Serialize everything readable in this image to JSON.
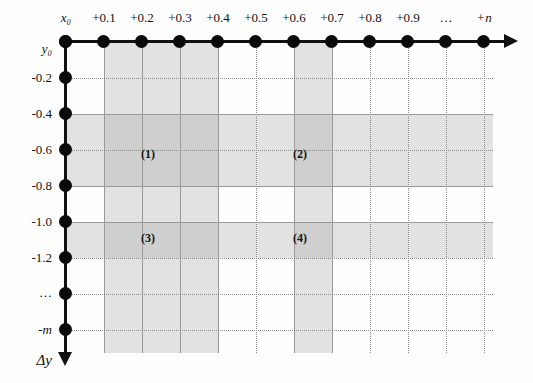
{
  "figure": {
    "background_color": "#ffffff",
    "axis_color": "#111111",
    "band_color": "#aaaaaa",
    "grid_color": "#8d8d8d"
  },
  "x_axis": {
    "name": "x-axis",
    "origin_label": "x₀",
    "labels": [
      "x₀",
      "+0.1",
      "+0.2",
      "+0.3",
      "+0.4",
      "+0.5",
      "+0.6",
      "+0.7",
      "+0.8",
      "+0.9",
      "…",
      "+n"
    ],
    "tick_count": 12,
    "arrow": "right"
  },
  "y_axis": {
    "name": "y-axis",
    "origin_label": "y₀",
    "labels": [
      "y₀",
      "-0.2",
      "-0.4",
      "-0.6",
      "-0.8",
      "-1.0",
      "-1.2",
      "…",
      "-m"
    ],
    "increment_label": "Δy",
    "tick_count": 9,
    "arrow": "down"
  },
  "regions": [
    {
      "label": "(1)",
      "name": "region-1"
    },
    {
      "label": "(2)",
      "name": "region-2"
    },
    {
      "label": "(3)",
      "name": "region-3"
    },
    {
      "label": "(4)",
      "name": "region-4"
    }
  ],
  "bands": {
    "vertical": [
      {
        "name": "vertical-band-a",
        "from": "+0.1",
        "to": "+0.4"
      },
      {
        "name": "vertical-band-b",
        "from": "+0.6",
        "to": "+0.7"
      }
    ],
    "horizontal": [
      {
        "name": "horizontal-band-a",
        "from": "-0.4",
        "to": "-0.8"
      },
      {
        "name": "horizontal-band-b",
        "from": "-1.0",
        "to": "-1.2"
      }
    ]
  }
}
